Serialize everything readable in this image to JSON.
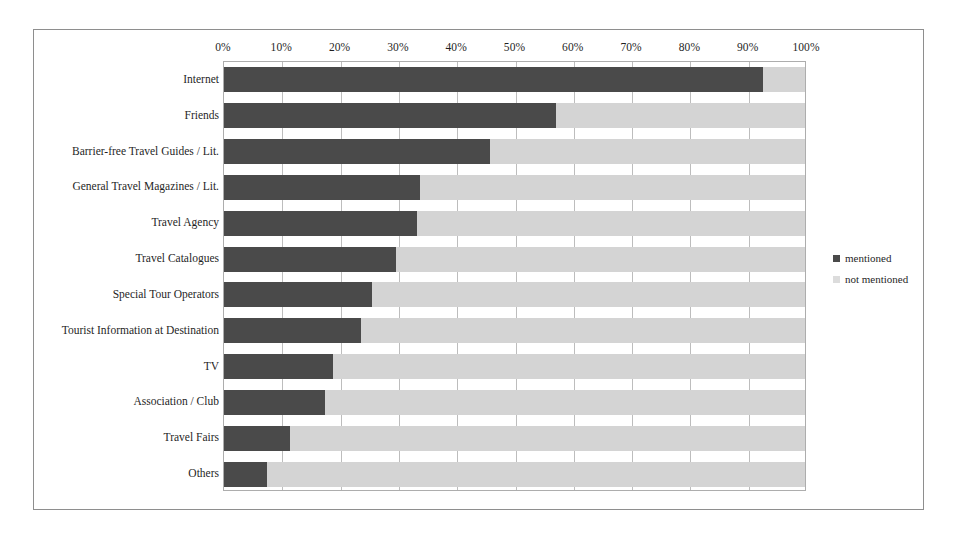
{
  "figure": {
    "background_color": "#ffffff",
    "frame_color": "#8e8e8e"
  },
  "legend": {
    "position": "right",
    "items": [
      {
        "label": "mentioned",
        "color": "#4a4a4a"
      },
      {
        "label": "not mentioned",
        "color": "#dcdcdc"
      }
    ]
  },
  "chart_data": {
    "type": "bar",
    "orientation": "horizontal",
    "stacked": true,
    "stack_total": 100,
    "title": "",
    "subtitle": "",
    "xlabel": "",
    "ylabel": "",
    "xlim": [
      0,
      100
    ],
    "grid": true,
    "axis_position": "top",
    "tick_labels": [
      "0%",
      "10%",
      "20%",
      "30%",
      "40%",
      "50%",
      "60%",
      "70%",
      "80%",
      "90%",
      "100%"
    ],
    "tick_values": [
      0,
      10,
      20,
      30,
      40,
      50,
      60,
      70,
      80,
      90,
      100
    ],
    "categories": [
      "Internet",
      "Friends",
      "Barrier-free Travel Guides / Lit.",
      "General Travel Magazines / Lit.",
      "Travel Agency",
      "Travel Catalogues",
      "Special Tour Operators",
      "Tourist Information at Destination",
      "TV",
      "Association / Club",
      "Travel Fairs",
      "Others"
    ],
    "series": [
      {
        "name": "mentioned",
        "color": "#4a4a4a",
        "values": [
          92.8,
          57.1,
          45.8,
          33.8,
          33.2,
          29.6,
          25.4,
          23.6,
          18.8,
          17.3,
          11.4,
          7.4
        ]
      },
      {
        "name": "not mentioned",
        "color": "#d4d4d4",
        "values": [
          7.2,
          42.9,
          54.2,
          66.2,
          66.8,
          70.4,
          74.6,
          76.4,
          81.2,
          82.7,
          88.6,
          92.6
        ]
      }
    ]
  }
}
